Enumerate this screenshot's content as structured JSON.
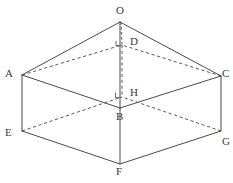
{
  "figure": {
    "canvas": {
      "width": 233,
      "height": 183
    },
    "background_color": "#ffffff",
    "solid_stroke_color": "#4a4a4a",
    "dashed_stroke_color": "#5a5a5a",
    "label_color": "#3a3a3a"
  },
  "vertices": [
    {
      "id": "O",
      "label": "O",
      "x": 120,
      "y": 22,
      "label_x": 116,
      "label_y": 5,
      "hidden": false,
      "role": "apex"
    },
    {
      "id": "D",
      "label": "D",
      "x": 122,
      "y": 45,
      "label_x": 130,
      "label_y": 36,
      "hidden": true,
      "role": "top-face-back"
    },
    {
      "id": "A",
      "label": "A",
      "x": 22,
      "y": 75,
      "label_x": 5,
      "label_y": 68,
      "hidden": false,
      "role": "top-face-left"
    },
    {
      "id": "C",
      "label": "C",
      "x": 221,
      "y": 76,
      "label_x": 222,
      "label_y": 68,
      "hidden": false,
      "role": "top-face-right"
    },
    {
      "id": "H",
      "label": "H",
      "x": 122,
      "y": 97,
      "label_x": 130,
      "label_y": 87,
      "hidden": true,
      "role": "bottom-face-back"
    },
    {
      "id": "B",
      "label": "B",
      "x": 120,
      "y": 108,
      "label_x": 116,
      "label_y": 111,
      "hidden": false,
      "role": "top-face-front"
    },
    {
      "id": "E",
      "label": "E",
      "x": 22,
      "y": 131,
      "label_x": 5,
      "label_y": 127,
      "hidden": false,
      "role": "bottom-face-left"
    },
    {
      "id": "G",
      "label": "G",
      "x": 221,
      "y": 131,
      "label_x": 222,
      "label_y": 136,
      "hidden": false,
      "role": "bottom-face-right"
    },
    {
      "id": "F",
      "label": "F",
      "x": 120,
      "y": 164,
      "label_x": 116,
      "label_y": 166,
      "hidden": false,
      "role": "bottom-face-front"
    }
  ],
  "edges": [
    {
      "from": "O",
      "to": "A",
      "style": "solid",
      "name": "edge-OA"
    },
    {
      "from": "O",
      "to": "C",
      "style": "solid",
      "name": "edge-OC"
    },
    {
      "from": "O",
      "to": "B",
      "style": "solid",
      "name": "edge-OB"
    },
    {
      "from": "A",
      "to": "D",
      "style": "dashed",
      "name": "edge-AD"
    },
    {
      "from": "C",
      "to": "D",
      "style": "dashed",
      "name": "edge-CD"
    },
    {
      "from": "A",
      "to": "B",
      "style": "solid",
      "name": "edge-AB"
    },
    {
      "from": "C",
      "to": "B",
      "style": "solid",
      "name": "edge-CB"
    },
    {
      "from": "A",
      "to": "E",
      "style": "solid",
      "name": "edge-AE"
    },
    {
      "from": "C",
      "to": "G",
      "style": "solid",
      "name": "edge-CG"
    },
    {
      "from": "B",
      "to": "F",
      "style": "solid",
      "name": "edge-BF"
    },
    {
      "from": "E",
      "to": "F",
      "style": "solid",
      "name": "edge-EF"
    },
    {
      "from": "G",
      "to": "F",
      "style": "solid",
      "name": "edge-GF"
    },
    {
      "from": "E",
      "to": "H",
      "style": "dashed",
      "name": "edge-EH"
    },
    {
      "from": "G",
      "to": "H",
      "style": "dashed",
      "name": "edge-GH"
    },
    {
      "from": "D",
      "to": "H",
      "style": "dashed",
      "name": "edge-DH"
    }
  ],
  "altitude": {
    "name": "altitude-O-to-H",
    "from": "O",
    "to": "H",
    "style": "dashed",
    "right_angle_at": "H"
  }
}
